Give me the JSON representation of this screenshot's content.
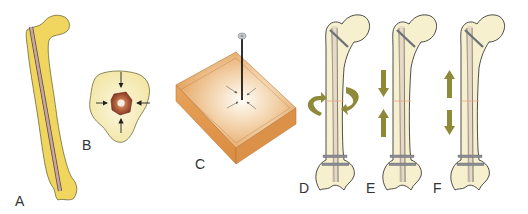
{
  "figure": {
    "panels": [
      {
        "id": "A",
        "label": "A",
        "description": "Femur with intramedullary nail"
      },
      {
        "id": "B",
        "label": "B",
        "description": "Cross-section with nail compressed by surrounding bone"
      },
      {
        "id": "C",
        "label": "C",
        "description": "Block with inserted pin, converging force arrows"
      },
      {
        "id": "D",
        "label": "D",
        "description": "Locked nail under rotational (torsion) loading"
      },
      {
        "id": "E",
        "label": "E",
        "description": "Locked nail under axial compression"
      },
      {
        "id": "F",
        "label": "F",
        "description": "Locked nail under axial distraction"
      }
    ],
    "colors": {
      "bone_yellow": "#f0d65e",
      "bone_cream": "#f7f0cf",
      "nail": "#c9a5a0",
      "block_orange": "#e3a25a",
      "arrow_olive": "#8f8a3a",
      "screw_gray": "#8a8f96",
      "outline": "#222222"
    }
  }
}
